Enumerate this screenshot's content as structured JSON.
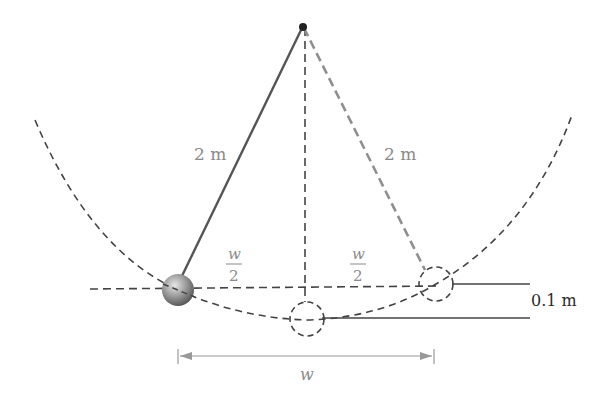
{
  "diagram": {
    "colors": {
      "dark_line": "#555555",
      "light_line": "#8f8f8f",
      "dashed": "#444444",
      "label_gray": "#8a8a8a",
      "label_dark": "#2a2a2a",
      "bob_fill": "#9a9a9a"
    },
    "labels": {
      "string_left": "2 m",
      "string_right": "2 m",
      "half_width_left_num": "w",
      "half_width_left_den": "2",
      "half_width_right_num": "w",
      "half_width_right_den": "2",
      "height_diff": "0.1 m",
      "width": "w"
    },
    "elements": {
      "pivot": "pivot point",
      "bob": "pendulum bob",
      "arc": "swing arc (dashed)",
      "vertical": "vertical reference (dashed)",
      "ghost_bottom": "bob at lowest point (dashed circle)",
      "ghost_right": "bob at right extreme (dashed circle)",
      "dimension": "width dimension arrow"
    }
  }
}
